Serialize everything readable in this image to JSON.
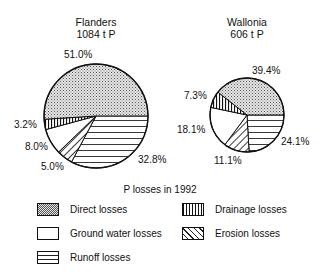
{
  "chart_data": [
    {
      "type": "pie",
      "title": "Flanders",
      "subtitle": "1084 t P",
      "categories": [
        "Runoff losses",
        "Erosion losses",
        "Ground water losses",
        "Drainage losses",
        "Direct losses"
      ],
      "values": [
        32.8,
        5.0,
        8.0,
        3.2,
        51.0
      ],
      "labels": [
        "32.8%",
        "5.0%",
        "8.0%",
        "3.2%",
        "51.0%"
      ]
    },
    {
      "type": "pie",
      "title": "Wallonia",
      "subtitle": "606 t P",
      "categories": [
        "Runoff losses",
        "Erosion losses",
        "Ground water losses",
        "Drainage losses",
        "Direct losses"
      ],
      "values": [
        24.1,
        11.1,
        18.1,
        7.3,
        39.4
      ],
      "labels": [
        "24.1%",
        "11.1%",
        "18.1%",
        "7.3%",
        "39.4%"
      ]
    }
  ],
  "flanders": {
    "title": "Flanders",
    "subtitle": "1084 t P",
    "labels": {
      "direct": "51.0%",
      "drainage": "3.2%",
      "groundwater": "8.0%",
      "erosion": "5.0%",
      "runoff": "32.8%"
    }
  },
  "wallonia": {
    "title": "Wallonia",
    "subtitle": "606 t P",
    "labels": {
      "direct": "39.4%",
      "drainage": "7.3%",
      "groundwater": "18.1%",
      "erosion": "11.1%",
      "runoff": "24.1%"
    }
  },
  "legend": {
    "title": "P losses in 1992",
    "items": {
      "direct": "Direct losses",
      "drainage": "Drainage losses",
      "groundwater": "Ground water losses",
      "erosion": "Erosion losses",
      "runoff": "Runoff losses"
    }
  }
}
